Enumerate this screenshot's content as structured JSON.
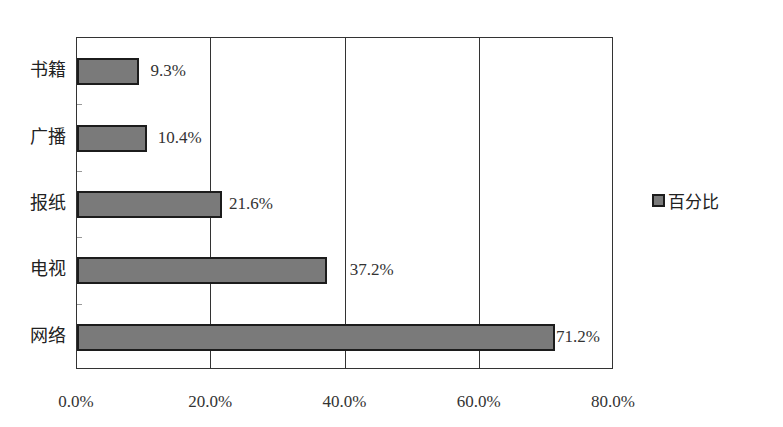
{
  "chart_data": {
    "type": "bar",
    "orientation": "horizontal",
    "title": "",
    "xlabel": "",
    "ylabel": "",
    "categories": [
      "书籍",
      "广播",
      "报纸",
      "电视",
      "网络"
    ],
    "series": [
      {
        "name": "百分比",
        "values": [
          9.3,
          10.4,
          21.6,
          37.2,
          71.2
        ],
        "color": "#7a7a7a"
      }
    ],
    "data_labels": [
      "9.3%",
      "10.4%",
      "21.6%",
      "37.2%",
      "71.2%"
    ],
    "xlim": [
      0,
      80
    ],
    "x_ticks": [
      "0.0%",
      "20.0%",
      "40.0%",
      "60.0%",
      "80.0%"
    ],
    "grid": {
      "vertical": true,
      "horizontal": false
    },
    "legend": {
      "position": "right",
      "entries": [
        "百分比"
      ]
    }
  },
  "legend": {
    "label": "百分比"
  }
}
